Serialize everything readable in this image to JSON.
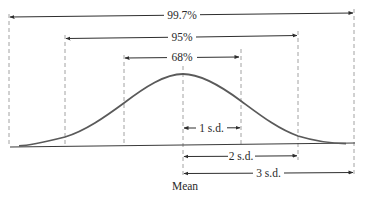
{
  "diagram": {
    "mean_label": "Mean",
    "intervals": [
      {
        "label": "99.7%",
        "range_sd": [
          -3,
          3
        ]
      },
      {
        "label": "95%",
        "range_sd": [
          -2,
          2
        ]
      },
      {
        "label": "68%",
        "range_sd": [
          -1,
          1
        ]
      }
    ],
    "sd_markers": [
      {
        "label": "1 s.d.",
        "sd": 1
      },
      {
        "label": "2 s.d.",
        "sd": 2
      },
      {
        "label": "3 s.d.",
        "sd": 3
      }
    ],
    "colors": {
      "curve": "#5a5a5a",
      "arrows": "#2e2e2e",
      "dashes": "#8a8a8a",
      "text": "#2a2a2a"
    }
  }
}
